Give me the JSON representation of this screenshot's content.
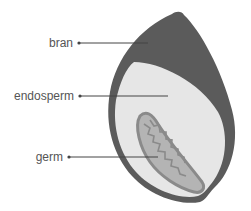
{
  "diagram": {
    "colors": {
      "bran": "#5b5b5b",
      "endosperm": "#e6e6e6",
      "germ_fill": "#b4b4b4",
      "germ_outline": "#8a8a8a",
      "leader_line": "#444444",
      "label_text": "#555555"
    },
    "labels": [
      {
        "id": "bran",
        "text": "bran"
      },
      {
        "id": "endosperm",
        "text": "endosperm"
      },
      {
        "id": "germ",
        "text": "germ"
      }
    ]
  }
}
